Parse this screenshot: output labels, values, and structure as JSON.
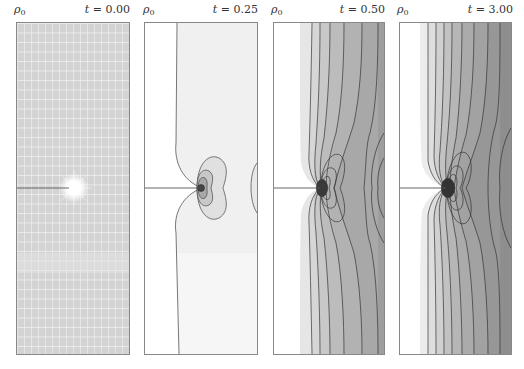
{
  "figure": {
    "panels": [
      {
        "id": "p1",
        "symbol": "ρ",
        "subscript": "0",
        "time_prefix": "t = ",
        "time": "0.00",
        "kind": "mesh"
      },
      {
        "id": "p2",
        "symbol": "ρ",
        "subscript": "0",
        "time_prefix": "t = ",
        "time": "0.25",
        "kind": "contour"
      },
      {
        "id": "p3",
        "symbol": "ρ",
        "subscript": "0",
        "time_prefix": "t = ",
        "time": "0.50",
        "kind": "contour"
      },
      {
        "id": "p4",
        "symbol": "ρ",
        "subscript": "0",
        "time_prefix": "t = ",
        "time": "3.00",
        "kind": "contour"
      }
    ],
    "colors": {
      "mesh_bg": "#d4d4d4",
      "mesh_line": "#f4f4f4",
      "crack": "#555555",
      "contour_line": "#333333",
      "border": "#888888"
    }
  }
}
